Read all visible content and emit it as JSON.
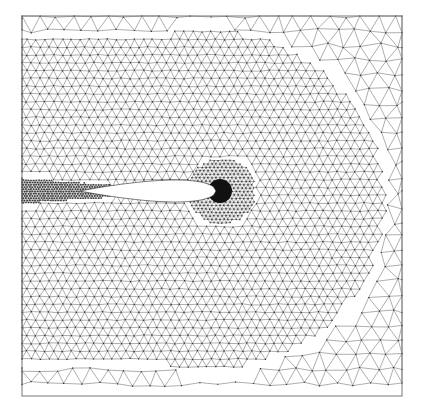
{
  "figure": {
    "type": "unstructured-triangular-mesh",
    "background": "#ffffff",
    "line_color": "#555555",
    "node_color": "#333333",
    "dense_color": "#111111"
  },
  "domain": {
    "x0": 22,
    "y0": 16,
    "x1": 402,
    "y1": 396
  },
  "mesh": {
    "base_spacing": 9,
    "coarse_spacing": 17,
    "fine_region": {
      "cx": 205,
      "cy": 200,
      "rx": 182,
      "ry": 172
    }
  },
  "airfoil": {
    "leading_edge_x": 216,
    "trailing_edge_x": 80,
    "chord_y": 191,
    "max_half_thickness": 11,
    "fill": "#ffffff"
  },
  "refinement": {
    "leading_edge_ring": {
      "cx": 222,
      "cy": 191,
      "r": 34
    },
    "leading_edge_core": {
      "cx": 220,
      "cy": 191,
      "r": 12
    },
    "wake_band": {
      "x0": 22,
      "x1": 110,
      "y_top": 178,
      "y_bottom": 204
    }
  }
}
